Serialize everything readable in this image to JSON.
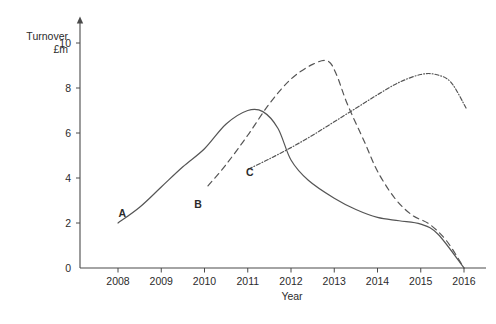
{
  "chart_data": {
    "type": "line",
    "title": "",
    "ylabel": "Turnover £m",
    "xlabel": "Year",
    "grid": false,
    "legend_position": "inline-labels",
    "x": [
      2008,
      2009,
      2010,
      2011,
      2012,
      2013,
      2014,
      2015,
      2016
    ],
    "xtick_labels": [
      "2008",
      "2009",
      "2010",
      "2011",
      "2012",
      "2013",
      "2014",
      "2015",
      "2016"
    ],
    "ytick_labels": [
      "0",
      "2",
      "4",
      "6",
      "8",
      "10"
    ],
    "ytick_values": [
      0,
      2,
      4,
      6,
      8,
      10
    ],
    "xlim": [
      2008,
      2016
    ],
    "ylim": [
      0,
      11
    ],
    "series": [
      {
        "name": "A",
        "style": "solid",
        "label_x": 2008.1,
        "label_y": 2.25,
        "points": [
          [
            2008,
            2.0
          ],
          [
            2008.5,
            2.7
          ],
          [
            2009,
            3.6
          ],
          [
            2009.5,
            4.5
          ],
          [
            2010,
            5.3
          ],
          [
            2010.5,
            6.4
          ],
          [
            2011,
            7.0
          ],
          [
            2011.35,
            6.95
          ],
          [
            2011.7,
            6.2
          ],
          [
            2012,
            4.8
          ],
          [
            2012.4,
            3.9
          ],
          [
            2013,
            3.1
          ],
          [
            2013.5,
            2.6
          ],
          [
            2014,
            2.25
          ],
          [
            2014.5,
            2.1
          ],
          [
            2015,
            1.95
          ],
          [
            2015.4,
            1.5
          ],
          [
            2016,
            0.0
          ]
        ]
      },
      {
        "name": "B",
        "style": "dashed",
        "label_x": 2009.85,
        "label_y": 2.65,
        "points": [
          [
            2010.08,
            3.65
          ],
          [
            2010.5,
            4.6
          ],
          [
            2011,
            5.9
          ],
          [
            2011.5,
            7.3
          ],
          [
            2012,
            8.4
          ],
          [
            2012.5,
            9.05
          ],
          [
            2012.85,
            9.2
          ],
          [
            2013.05,
            8.6
          ],
          [
            2013.3,
            7.3
          ],
          [
            2013.7,
            5.6
          ],
          [
            2014,
            4.3
          ],
          [
            2014.4,
            3.1
          ],
          [
            2014.8,
            2.35
          ],
          [
            2015.2,
            1.95
          ],
          [
            2015.6,
            1.2
          ],
          [
            2016,
            0.0
          ]
        ]
      },
      {
        "name": "C",
        "style": "dash-dot",
        "label_x": 2011.05,
        "label_y": 4.1,
        "points": [
          [
            2011.02,
            4.4
          ],
          [
            2011.5,
            4.85
          ],
          [
            2012,
            5.35
          ],
          [
            2012.5,
            5.9
          ],
          [
            2013,
            6.5
          ],
          [
            2013.5,
            7.1
          ],
          [
            2014,
            7.7
          ],
          [
            2014.5,
            8.25
          ],
          [
            2015,
            8.6
          ],
          [
            2015.35,
            8.6
          ],
          [
            2015.7,
            8.25
          ],
          [
            2016.05,
            7.1
          ]
        ]
      }
    ]
  },
  "axis_labels": {
    "y_line1": "Turnover",
    "y_line2": "£m",
    "x_title": "Year"
  },
  "colors": {
    "axis": "#4a4a4a",
    "curve": "#555555",
    "text": "#2b2b2b",
    "background": "#ffffff"
  }
}
